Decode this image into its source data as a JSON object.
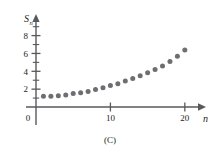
{
  "caption": "(C)",
  "colors": {
    "axis": "#58595b",
    "point": "#6d6e71",
    "text": "#231f20"
  },
  "axes": {
    "ylabel_main": "S",
    "ylabel_sub": "n",
    "xlabel": "n",
    "y_ticks_major": [
      2,
      4,
      6,
      8
    ],
    "y_ticks_minor": [
      1,
      3,
      5,
      7,
      9
    ],
    "x_ticks_major": [
      10,
      20
    ],
    "origin_label": "0"
  },
  "chart_data": {
    "type": "scatter",
    "title": "(C)",
    "xlabel": "n",
    "ylabel": "S_n",
    "xlim": [
      0,
      21.5
    ],
    "ylim": [
      0,
      9.3
    ],
    "grid": false,
    "legend": null,
    "x": [
      1,
      2,
      3,
      4,
      5,
      6,
      7,
      8,
      9,
      10,
      11,
      12,
      13,
      14,
      15,
      16,
      17,
      18,
      19,
      20
    ],
    "y": [
      1.2,
      1.2,
      1.25,
      1.35,
      1.5,
      1.6,
      1.75,
      1.95,
      2.15,
      2.4,
      2.6,
      2.9,
      3.2,
      3.5,
      3.85,
      4.2,
      4.6,
      5.1,
      5.7,
      6.4
    ],
    "series": [
      {
        "name": "S_n",
        "values": [
          1.2,
          1.2,
          1.25,
          1.35,
          1.5,
          1.6,
          1.75,
          1.95,
          2.15,
          2.4,
          2.6,
          2.9,
          3.2,
          3.5,
          3.85,
          4.2,
          4.6,
          5.1,
          5.7,
          6.4
        ]
      }
    ]
  }
}
